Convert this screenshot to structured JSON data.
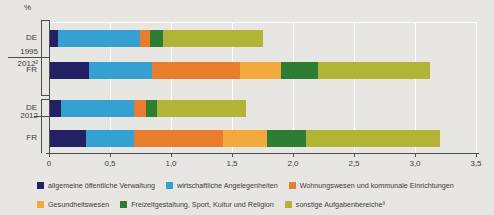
{
  "chart_data": {
    "type": "bar",
    "orientation": "horizontal-stacked",
    "unit_label": "%",
    "x_ticks": [
      "0",
      "0,5",
      "1,0",
      "1,5",
      "2,0",
      "2,5",
      "3,0",
      "3,5"
    ],
    "x_range": [
      0,
      3.5
    ],
    "grid": "white vertical gridlines every 0.5",
    "legend_position": "bottom",
    "legend": [
      {
        "key": "allgemeine-oeffentliche-verwaltung",
        "label": "allgemeine öffentliche Verwaltung",
        "color": "#232063"
      },
      {
        "key": "wirtschaftliche-angelegenheiten",
        "label": "wirtschaftliche Angelegenheiten",
        "color": "#35a1d3"
      },
      {
        "key": "wohnungswesen-und-kommunale-einrichtungen",
        "label": "Wohnungswesen und kommunale Einrichtungen",
        "color": "#e87e2d"
      },
      {
        "key": "gesundheitswesen",
        "label": "Gesundheitswesen",
        "color": "#f3aa3c"
      },
      {
        "key": "freizeitgestaltung-sport-kultur-religion",
        "label": "Freizeitgestaltung, Sport, Kultur und Religion",
        "color": "#2e7d33"
      },
      {
        "key": "sonstige-aufgabenbereiche",
        "label": "sonstige Aufgabenbereiche³",
        "color": "#b2b438"
      }
    ],
    "groups": [
      {
        "period_lines": [
          "1995",
          "2012²"
        ],
        "bars": [
          {
            "country": "DE",
            "values": [
              0.07,
              0.67,
              0.08,
              0,
              0.11,
              0.82
            ],
            "total": 1.75
          },
          {
            "country": "FR",
            "values": [
              0.33,
              0.52,
              0.72,
              0.34,
              0.3,
              0.92
            ],
            "total": 3.13
          }
        ]
      },
      {
        "period_lines": [
          "2012"
        ],
        "bars": [
          {
            "country": "DE",
            "values": [
              0.1,
              0.6,
              0.1,
              0,
              0.09,
              0.73
            ],
            "total": 1.62
          },
          {
            "country": "FR",
            "values": [
              0.3,
              0.39,
              0.73,
              0.36,
              0.32,
              1.1
            ],
            "total": 3.2
          }
        ]
      }
    ]
  }
}
